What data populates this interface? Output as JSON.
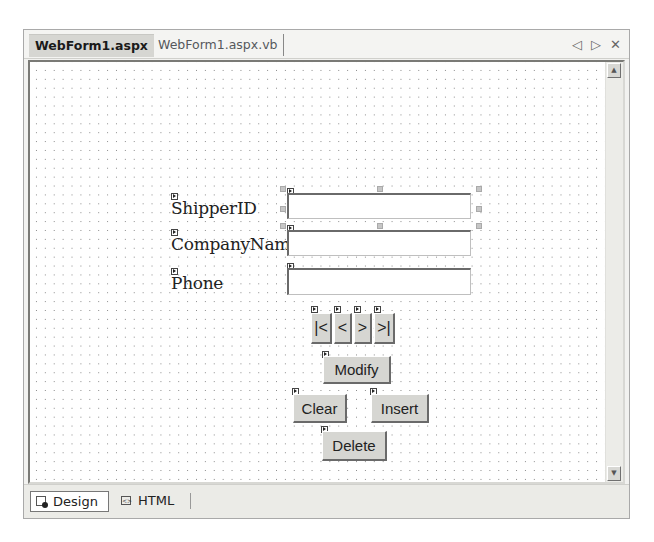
{
  "document_tabs": [
    {
      "label": "WebForm1.aspx",
      "active": true
    },
    {
      "label": "WebForm1.aspx.vb",
      "active": false
    }
  ],
  "tab_controls": {
    "scroll_left": "◁",
    "scroll_right": "▷",
    "close": "✕"
  },
  "form": {
    "fields": [
      {
        "label": "ShipperID",
        "value": ""
      },
      {
        "label": "CompanyName",
        "value": ""
      },
      {
        "label": "Phone",
        "value": ""
      }
    ],
    "nav_buttons": [
      {
        "label": "|<",
        "name": "first"
      },
      {
        "label": "<",
        "name": "previous"
      },
      {
        "label": ">",
        "name": "next"
      },
      {
        "label": ">|",
        "name": "last"
      }
    ],
    "buttons": {
      "modify": "Modify",
      "clear": "Clear",
      "insert": "Insert",
      "delete": "Delete"
    }
  },
  "scrollbar": {
    "up": "▲",
    "down": "▼"
  },
  "view_tabs": [
    {
      "label": "Design",
      "active": true
    },
    {
      "label": "HTML",
      "active": false
    }
  ],
  "colors": {
    "canvas_bg": "#ffffff",
    "grid_dot": "#8a8a8a",
    "button_face": "#d6d6d2",
    "chrome_bg": "#f2f2f0"
  }
}
